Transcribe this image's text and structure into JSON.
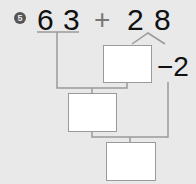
{
  "problem": {
    "number": "5",
    "operand1": {
      "tens": "6",
      "ones": "3"
    },
    "operator": "+",
    "operand2": {
      "tens": "2",
      "ones": "8"
    },
    "adjust_label": "−2"
  },
  "boxes": [
    {
      "id": "box-1",
      "value": ""
    },
    {
      "id": "box-2",
      "value": ""
    },
    {
      "id": "box-3",
      "value": ""
    }
  ],
  "colors": {
    "background": "#e9e9e9",
    "line": "#999999",
    "text": "#111111"
  }
}
